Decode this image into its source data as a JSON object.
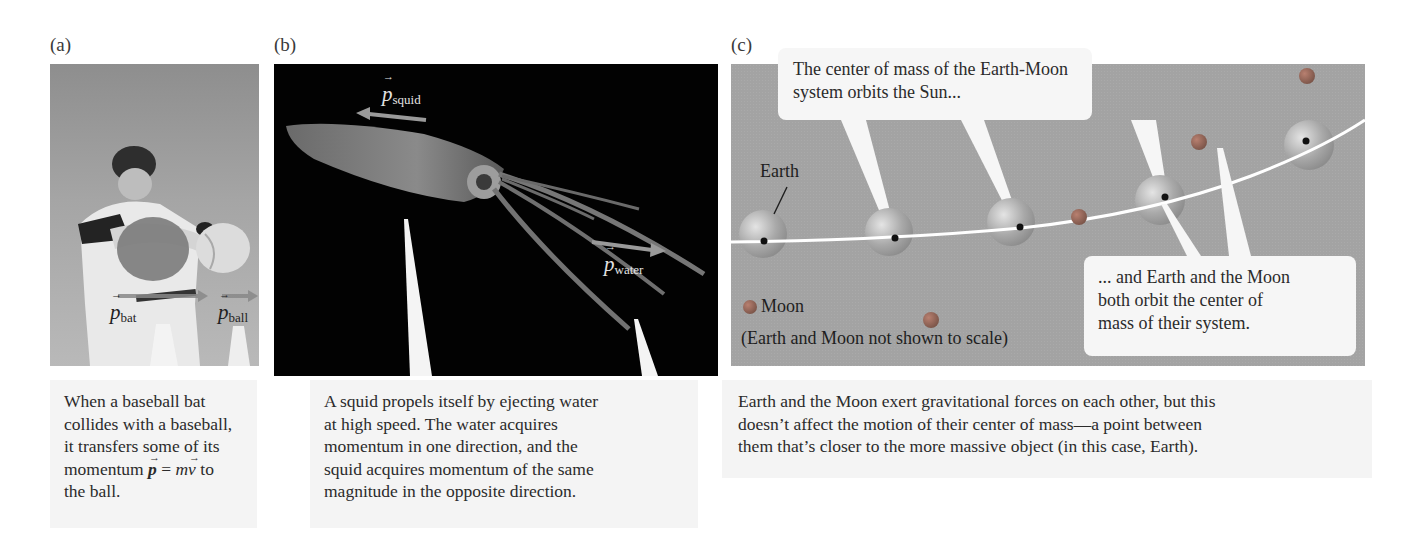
{
  "figure": {
    "panels": [
      {
        "label": "(a)",
        "subject": "baseball-batter-photo",
        "vector_labels": [
          {
            "symbol": "p",
            "subscript": "bat"
          },
          {
            "symbol": "p",
            "subscript": "ball"
          }
        ],
        "caption": {
          "line1": "When a baseball bat",
          "line2": "collides with a baseball,",
          "line3": "it transfers some of its",
          "line4_prefix": "momentum ",
          "line4_eq_lhs": "p",
          "line4_eq_sign": " = ",
          "line4_eq_m": "m",
          "line4_eq_v": "v",
          "line4_suffix": " to",
          "line5": "the ball."
        }
      },
      {
        "label": "(b)",
        "subject": "squid-photo",
        "vector_labels": [
          {
            "symbol": "p",
            "subscript": "squid"
          },
          {
            "symbol": "p",
            "subscript": "water"
          }
        ],
        "caption": {
          "line1": "A squid propels itself by ejecting water",
          "line2": "at high speed. The water acquires",
          "line3": "momentum in one direction, and the",
          "line4": "squid acquires momentum of the same",
          "line5": "magnitude in the opposite direction."
        }
      },
      {
        "label": "(c)",
        "subject": "earth-moon-orbit-diagram",
        "earth_label": "Earth",
        "moon_legend": "Moon",
        "scale_note": "(Earth and Moon not shown to scale)",
        "bubble_top": {
          "line1": "The center of mass of the Earth-Moon",
          "line2": "system orbits the Sun..."
        },
        "bubble_bottom": {
          "line1": "... and Earth and the Moon",
          "line2": "both orbit the center of",
          "line3": "mass of their system."
        },
        "caption": {
          "line1": "Earth and the Moon exert gravitational forces on each other, but this",
          "line2": "doesn’t affect the motion of their center of mass—a point between",
          "line3": "them that’s closer to the more massive object (in this case, Earth)."
        }
      }
    ],
    "colors": {
      "caption_bg": "#f4f4f4",
      "panel_c_bg": "#a3a3a3",
      "squid_bg": "#020202",
      "orbit_line": "#ffffff",
      "moon": "#a06a5a"
    }
  }
}
